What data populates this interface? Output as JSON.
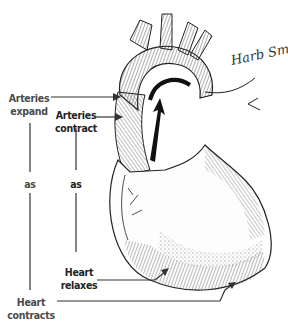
{
  "diagram": {
    "labels": {
      "arteries_expand": [
        "Arteries",
        "expand"
      ],
      "arteries_contract": [
        "Arteries",
        "contract"
      ],
      "as_left": "as",
      "as_right": "as",
      "heart_relaxes": [
        "Heart",
        "relaxes"
      ],
      "heart_contracts": [
        "Heart",
        "contracts"
      ]
    },
    "signature": "Harb Sms",
    "colors": {
      "ink": "#2a2a2a",
      "label_text": "#4a4a4a",
      "background": "#ffffff"
    }
  }
}
